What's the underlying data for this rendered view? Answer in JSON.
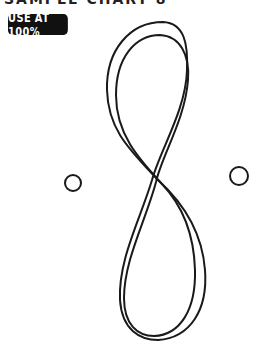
{
  "header": {
    "clipped_title": "SAMPLE CHART 8"
  },
  "badge": {
    "label": "USE AT 100%",
    "bg_color": "#111111",
    "text_color": "#ffffff"
  },
  "artwork": {
    "shape": "figure-eight double stroke",
    "stroke_color": "#1a1a1a",
    "circles": [
      {
        "name": "left-circle",
        "cx": 73,
        "cy": 183,
        "r": 8
      },
      {
        "name": "right-circle",
        "cx": 239,
        "cy": 176,
        "r": 9
      }
    ]
  }
}
